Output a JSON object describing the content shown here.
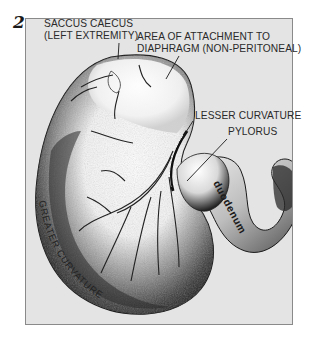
{
  "figure": {
    "number": "2"
  },
  "labels": {
    "saccus_caecus": {
      "line1": "SACCUS CAECUS",
      "line2": "(LEFT EXTREMITY)"
    },
    "area_attachment": {
      "line1": "AREA OF ATTACHMENT TO",
      "line2": "DIAPHRAGM (NON-PERITONEAL)"
    },
    "lesser_curvature": "LESSER CURVATURE",
    "pylorus": "PYLORUS",
    "duodenum": "duodenum",
    "greater_curvature": "GREATER CURVATURE"
  },
  "colors": {
    "frame_background": "#e4e4e4",
    "frame_border": "#8a8a8a",
    "ink": "#1a1a1a",
    "label_text": "#2a2a2a"
  }
}
